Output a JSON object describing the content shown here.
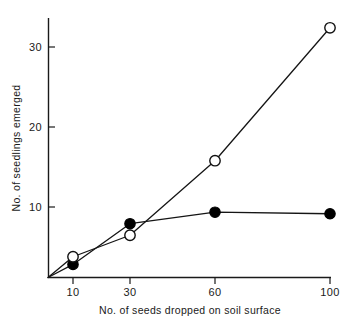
{
  "chart_data": {
    "type": "line",
    "title": "",
    "xlabel": "No. of seeds dropped on soil surface",
    "ylabel": "No. of seedlings emerged",
    "x": [
      10,
      30,
      60,
      100
    ],
    "xtick_labels": [
      "10",
      "30",
      "60",
      "100"
    ],
    "ytick_labels": [
      "10",
      "20",
      "30"
    ],
    "yticks": [
      10,
      20,
      30
    ],
    "xlim": [
      0,
      108
    ],
    "ylim": [
      0,
      36
    ],
    "grid": false,
    "legend": "none",
    "origin_included": true,
    "series": [
      {
        "name": "open-circle-series",
        "marker": "open-circle",
        "values": [
          2.7,
          5.5,
          15.2,
          32.5
        ]
      },
      {
        "name": "filled-circle-series",
        "marker": "filled-circle",
        "values": [
          1.7,
          7.0,
          8.5,
          8.3
        ]
      }
    ]
  },
  "axes": {
    "y_caption": "No. of seedlings emerged",
    "x_caption": "No. of seeds dropped on soil surface",
    "y_ticks": [
      {
        "label": "30",
        "value": 30
      },
      {
        "label": "20",
        "value": 20
      },
      {
        "label": "10",
        "value": 10
      }
    ],
    "x_ticks": [
      {
        "label": "10",
        "value": 10
      },
      {
        "label": "30",
        "value": 30
      },
      {
        "label": "60",
        "value": 60
      },
      {
        "label": "100",
        "value": 100
      }
    ]
  },
  "style": {
    "ink": "#1a1a1a",
    "background": "#ffffff",
    "marker_fill_open": "#ffffff",
    "marker_fill_closed": "#000000"
  }
}
